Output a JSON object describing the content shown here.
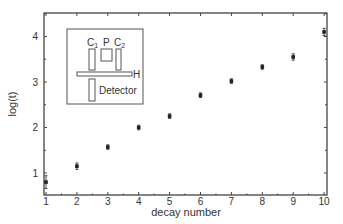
{
  "chart_data": {
    "type": "scatter",
    "title": "",
    "xlabel": "decay number",
    "ylabel": "log(t)",
    "xlim": [
      0.95,
      10.1
    ],
    "ylim": [
      0.52,
      4.52
    ],
    "xticks": [
      1,
      2,
      3,
      4,
      5,
      6,
      7,
      8,
      9,
      10
    ],
    "yticks": [
      1,
      2,
      3,
      4
    ],
    "grid": false,
    "legend": null,
    "series": [
      {
        "name": "log(t)",
        "x": [
          1,
          2,
          3,
          4,
          5,
          6,
          7,
          8,
          9,
          10
        ],
        "y": [
          0.8,
          1.15,
          1.57,
          2.0,
          2.25,
          2.71,
          3.02,
          3.33,
          3.55,
          4.1
        ],
        "yerr": [
          0.14,
          0.07,
          0.05,
          0.05,
          0.05,
          0.05,
          0.05,
          0.05,
          0.07,
          0.08
        ]
      }
    ],
    "inset": {
      "description": "schematic diagram",
      "labels": {
        "c1": "C",
        "c1_sub": "1",
        "p": "P",
        "c2": "C",
        "c2_sub": "2",
        "h": "H",
        "detector": "Detector"
      }
    }
  },
  "axes": {
    "x_tick_labels": [
      "1",
      "2",
      "3",
      "4",
      "5",
      "6",
      "7",
      "8",
      "9",
      "10"
    ],
    "y_tick_labels": [
      "1",
      "2",
      "3",
      "4"
    ],
    "xlabel": "decay number",
    "ylabel": "log(t)"
  },
  "colors": {
    "axis": "#444444",
    "marker": "#222222",
    "inset_stroke": "#555555",
    "text": "#333333"
  }
}
